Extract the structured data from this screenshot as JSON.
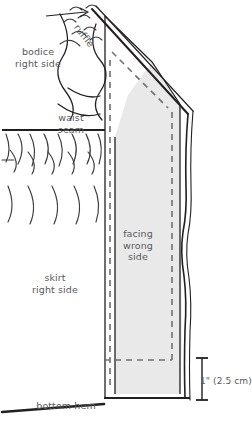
{
  "diagram": {
    "type": "sewing-illustration",
    "labels": {
      "bodice": "bodice\nright side",
      "ruffle": "ruffle",
      "waist_seam": "waist\nseam",
      "skirt": "skirt\nright side",
      "facing": "facing\nwrong\nside",
      "bottom_hem": "bottom hem",
      "dimension": "1\" (2.5 cm)"
    },
    "colors": {
      "ink": "#231f20",
      "text": "#58595b",
      "facing_fill": "#e9e9e9",
      "facing_fill_edge": "#dcdcdc",
      "paper": "#ffffff"
    },
    "annotations": {
      "dimension_value": "1\"",
      "dimension_metric": "2.5 cm",
      "stitch_style": "dashed",
      "facing_side_shown": "wrong side",
      "skirt_side_shown": "right side",
      "bodice_side_shown": "right side"
    }
  }
}
